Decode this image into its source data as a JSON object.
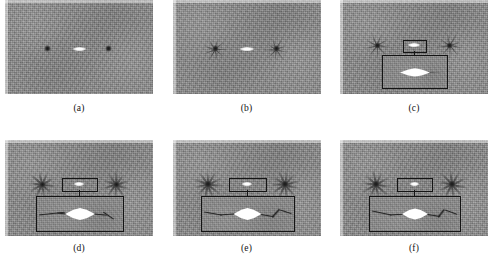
{
  "figure": {
    "type": "multi-panel-grayscale-image-figure",
    "rows": 2,
    "columns": 3,
    "background_gray": "#8a8a8a",
    "bright_feature_color": "#ffffff",
    "dark_feature_color": "#1a1a1a",
    "annotation_color": "#141414"
  },
  "panels": [
    {
      "id": "a",
      "caption": "(a)",
      "has_roi": false,
      "has_inset": false,
      "sources": [
        {
          "name": "left-dark-core",
          "x_pct": 29,
          "y_pct": 52,
          "size_px": 5,
          "spikes": 0
        },
        {
          "name": "right-dark-core",
          "x_pct": 70,
          "y_pct": 52,
          "size_px": 5,
          "spikes": 0
        }
      ],
      "central_streak": {
        "x_pct": 50,
        "y_pct": 52,
        "width_px": 13,
        "height_px": 3
      }
    },
    {
      "id": "b",
      "caption": "(b)",
      "has_roi": false,
      "has_inset": false,
      "sources": [
        {
          "name": "left-dark-core",
          "x_pct": 29,
          "y_pct": 52,
          "size_px": 6,
          "spikes": 9
        },
        {
          "name": "right-dark-core",
          "x_pct": 70,
          "y_pct": 52,
          "size_px": 6,
          "spikes": 9
        }
      ],
      "central_streak": {
        "x_pct": 50,
        "y_pct": 52,
        "width_px": 14,
        "height_px": 4
      }
    },
    {
      "id": "c",
      "caption": "(c)",
      "has_roi": true,
      "has_inset": true,
      "sources": [
        {
          "name": "left-dark-core",
          "x_pct": 25,
          "y_pct": 48,
          "size_px": 6,
          "spikes": 9
        },
        {
          "name": "right-dark-core",
          "x_pct": 74,
          "y_pct": 48,
          "size_px": 6,
          "spikes": 9
        }
      ],
      "central_streak": {
        "x_pct": 50,
        "y_pct": 48,
        "width_px": 12,
        "height_px": 4
      },
      "roi": {
        "x_pct": 50,
        "y_pct": 48,
        "width_px": 22,
        "height_px": 11
      },
      "inset": {
        "x_pct": 50,
        "y_pct": 76,
        "width_px": 64,
        "height_px": 32
      },
      "inset_content": {
        "lens_width_px": 30,
        "lens_height_px": 9,
        "filament_stage": "none"
      }
    },
    {
      "id": "d",
      "caption": "(d)",
      "has_roi": true,
      "has_inset": true,
      "sources": [
        {
          "name": "left-dark-core",
          "x_pct": 25,
          "y_pct": 46,
          "size_px": 6,
          "spikes": 10
        },
        {
          "name": "right-dark-core",
          "x_pct": 75,
          "y_pct": 46,
          "size_px": 6,
          "spikes": 10
        }
      ],
      "central_streak": {
        "x_pct": 50,
        "y_pct": 46,
        "width_px": 10,
        "height_px": 4
      },
      "roi": {
        "x_pct": 50,
        "y_pct": 46,
        "width_px": 34,
        "height_px": 12
      },
      "inset": {
        "x_pct": 50,
        "y_pct": 76,
        "width_px": 86,
        "height_px": 34
      },
      "inset_content": {
        "lens_width_px": 30,
        "lens_height_px": 13,
        "filament_stage": "emerging"
      }
    },
    {
      "id": "e",
      "caption": "(e)",
      "has_roi": true,
      "has_inset": true,
      "sources": [
        {
          "name": "left-dark-core",
          "x_pct": 24,
          "y_pct": 46,
          "size_px": 7,
          "spikes": 11
        },
        {
          "name": "right-dark-core",
          "x_pct": 76,
          "y_pct": 46,
          "size_px": 7,
          "spikes": 11
        }
      ],
      "central_streak": {
        "x_pct": 50,
        "y_pct": 46,
        "width_px": 10,
        "height_px": 4
      },
      "roi": {
        "x_pct": 50,
        "y_pct": 46,
        "width_px": 36,
        "height_px": 12
      },
      "inset": {
        "x_pct": 50,
        "y_pct": 76,
        "width_px": 92,
        "height_px": 34
      },
      "inset_content": {
        "lens_width_px": 28,
        "lens_height_px": 13,
        "filament_stage": "developed"
      }
    },
    {
      "id": "f",
      "caption": "(f)",
      "has_roi": true,
      "has_inset": true,
      "sources": [
        {
          "name": "left-dark-core",
          "x_pct": 24,
          "y_pct": 46,
          "size_px": 7,
          "spikes": 10
        },
        {
          "name": "right-dark-core",
          "x_pct": 76,
          "y_pct": 46,
          "size_px": 7,
          "spikes": 10
        }
      ],
      "central_streak": {
        "x_pct": 50,
        "y_pct": 46,
        "width_px": 9,
        "height_px": 4
      },
      "roi": {
        "x_pct": 50,
        "y_pct": 46,
        "width_px": 34,
        "height_px": 12
      },
      "inset": {
        "x_pct": 50,
        "y_pct": 76,
        "width_px": 90,
        "height_px": 34
      },
      "inset_content": {
        "lens_width_px": 26,
        "lens_height_px": 12,
        "filament_stage": "developed"
      }
    }
  ]
}
